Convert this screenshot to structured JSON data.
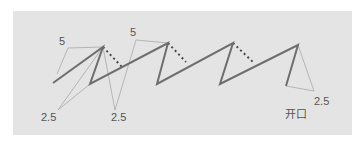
{
  "diagram": {
    "title": "",
    "colors": {
      "background": "#e4e4e4",
      "thick_line": "#6e6e6e",
      "thin_line": "#a8a8a8",
      "dotted_line": "#4a4a4a",
      "label": "#555555"
    },
    "zigzag_points": [
      [
        53,
        83
      ],
      [
        103,
        47
      ],
      [
        90,
        84
      ],
      [
        168,
        43
      ],
      [
        157,
        84
      ],
      [
        233,
        43
      ],
      [
        220,
        84
      ],
      [
        298,
        45
      ],
      [
        286,
        86
      ]
    ],
    "dotted_segments": [
      [
        [
          103,
          47
        ],
        [
          122,
          67
        ]
      ],
      [
        [
          168,
          43
        ],
        [
          186,
          62
        ]
      ],
      [
        [
          233,
          43
        ],
        [
          254,
          63
        ]
      ]
    ],
    "thin_segments": [
      [
        [
          57,
          74
        ],
        [
          68,
          48
        ]
      ],
      [
        [
          68,
          48
        ],
        [
          103,
          47
        ]
      ],
      [
        [
          103,
          47
        ],
        [
          58,
          110
        ]
      ],
      [
        [
          103,
          47
        ],
        [
          115,
          110
        ]
      ],
      [
        [
          90,
          84
        ],
        [
          58,
          110
        ]
      ],
      [
        [
          136,
          40
        ],
        [
          168,
          43
        ]
      ],
      [
        [
          136,
          40
        ],
        [
          115,
          110
        ]
      ],
      [
        [
          298,
          45
        ],
        [
          314,
          91
        ]
      ],
      [
        [
          314,
          91
        ],
        [
          286,
          86
        ]
      ]
    ],
    "labels": [
      {
        "id": "dim-5-left",
        "text": "5",
        "x": 59,
        "y": 36
      },
      {
        "id": "dim-5-mid",
        "text": "5",
        "x": 130,
        "y": 27
      },
      {
        "id": "dim-2.5-left",
        "text": "2.5",
        "x": 41,
        "y": 112
      },
      {
        "id": "dim-2.5-mid",
        "text": "2.5",
        "x": 111,
        "y": 112
      },
      {
        "id": "dim-2.5-right",
        "text": "2.5",
        "x": 314,
        "y": 96
      },
      {
        "id": "opening-label",
        "text": "开口",
        "x": 285,
        "y": 109
      }
    ]
  }
}
